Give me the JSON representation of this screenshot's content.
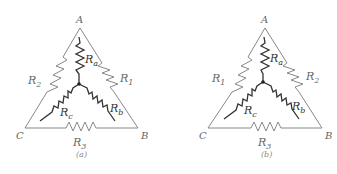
{
  "diagrams": [
    {
      "id": "a",
      "caption": "(a)",
      "nodes": {
        "A": "A",
        "B": "B",
        "C": "C"
      },
      "delta_resistors": {
        "AB": "R",
        "AB_sub": "1",
        "AC": "R",
        "AC_sub": "2",
        "CB": "R",
        "CB_sub": "3"
      },
      "star_resistors": {
        "a": "R",
        "a_sub": "a",
        "b": "R",
        "b_sub": "b",
        "c": "R",
        "c_sub": "c"
      }
    },
    {
      "id": "b",
      "caption": "(b)",
      "nodes": {
        "A": "A",
        "B": "B",
        "C": "C"
      },
      "delta_resistors": {
        "AC": "R",
        "AC_sub": "1",
        "AB": "R",
        "AB_sub": "2",
        "CB": "R",
        "CB_sub": "3"
      },
      "star_resistors": {
        "a": "R",
        "a_sub": "a",
        "b": "R",
        "b_sub": "b",
        "c": "R",
        "c_sub": "c"
      }
    }
  ]
}
